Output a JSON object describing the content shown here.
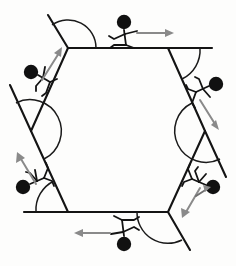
{
  "diagram": {
    "shape_name": "regular-hexagon",
    "sides": 6,
    "exterior_angle_degrees": 60,
    "interior_angle_degrees": 120,
    "exterior_angle_sum_degrees": 360,
    "background_color": "#fdfdfc",
    "line_color": "#141414",
    "arrow_color": "#8a8a8a",
    "figure_color": "#111111",
    "canvas": {
      "width": 236,
      "height": 266
    }
  },
  "hexagon": {
    "center": {
      "x": 118,
      "y": 131
    },
    "vertices": [
      {
        "id": "v-top-left",
        "label": "A",
        "x": 68,
        "y": 48
      },
      {
        "id": "v-top-right",
        "label": "B",
        "x": 168,
        "y": 48
      },
      {
        "id": "v-right",
        "label": "C",
        "x": 205,
        "y": 131
      },
      {
        "id": "v-bottom-right",
        "label": "D",
        "x": 168,
        "y": 212
      },
      {
        "id": "v-bottom-left",
        "label": "E",
        "x": 68,
        "y": 212
      },
      {
        "id": "v-left",
        "label": "F",
        "x": 31,
        "y": 131
      }
    ],
    "edges": [
      {
        "id": "edge-top",
        "from": "A",
        "to": "B"
      },
      {
        "id": "edge-upper-right",
        "from": "B",
        "to": "C"
      },
      {
        "id": "edge-lower-right",
        "from": "C",
        "to": "D"
      },
      {
        "id": "edge-bottom",
        "from": "D",
        "to": "E"
      },
      {
        "id": "edge-lower-left",
        "from": "E",
        "to": "F"
      },
      {
        "id": "edge-upper-left",
        "from": "F",
        "to": "A"
      }
    ]
  },
  "extension_rays": [
    {
      "id": "ray-top-left",
      "at_vertex": "A",
      "x1": 68,
      "y1": 48,
      "x2": 48,
      "y2": 15,
      "note": "upper-left edge extended beyond A"
    },
    {
      "id": "ray-top-right",
      "at_vertex": "B",
      "x1": 168,
      "y1": 48,
      "x2": 210,
      "y2": 48,
      "note": "top edge extended beyond B"
    },
    {
      "id": "ray-right",
      "at_vertex": "C",
      "x1": 205,
      "y1": 131,
      "x2": 226,
      "y2": 166,
      "note": "upper-right edge extended beyond C"
    },
    {
      "id": "ray-bottom-right",
      "at_vertex": "D",
      "x1": 168,
      "y1": 212,
      "x2": 188,
      "y2": 246,
      "note": "lower-right edge extended beyond D"
    },
    {
      "id": "ray-bottom-left",
      "at_vertex": "E",
      "x1": 68,
      "y1": 212,
      "x2": 26,
      "y2": 212,
      "note": "bottom edge extended beyond E"
    },
    {
      "id": "ray-left",
      "at_vertex": "F",
      "x1": 31,
      "y1": 131,
      "x2": 11,
      "y2": 96,
      "note": "lower-left edge extended beyond F"
    }
  ],
  "angle_arcs": [
    {
      "id": "arc-top-left",
      "at_vertex": "A",
      "radius": 27,
      "start_deg": 180,
      "end_deg": 240,
      "measure": 60
    },
    {
      "id": "arc-top-right",
      "at_vertex": "B",
      "radius": 27,
      "start_deg": 0,
      "end_deg": 60,
      "measure": 60
    },
    {
      "id": "arc-right",
      "at_vertex": "C",
      "radius": 27,
      "start_deg": 60,
      "end_deg": 120,
      "measure": 60
    },
    {
      "id": "arc-bottom-right",
      "at_vertex": "D",
      "radius": 27,
      "start_deg": 120,
      "end_deg": 180,
      "measure": 60
    },
    {
      "id": "arc-bottom-left",
      "at_vertex": "E",
      "radius": 27,
      "start_deg": 180,
      "end_deg": 240,
      "measure": 60
    },
    {
      "id": "arc-left",
      "at_vertex": "F",
      "radius": 27,
      "start_deg": 240,
      "end_deg": 300,
      "measure": 60
    }
  ],
  "walkers": [
    {
      "id": "walker-top",
      "position_label": "top edge",
      "head": {
        "x": 124,
        "y": 22
      },
      "standing_on": "edge-top",
      "heading_degrees": 0,
      "direction_label": "right",
      "arrow": {
        "x1": 137,
        "y1": 36,
        "x2": 172,
        "y2": 36
      }
    },
    {
      "id": "walker-upper-left",
      "position_label": "upper-left edge",
      "head": {
        "x": 32,
        "y": 72
      },
      "standing_on": "edge-upper-left",
      "heading_degrees": 60,
      "direction_label": "up-right",
      "arrow": {
        "x1": 42,
        "y1": 78,
        "x2": 61,
        "y2": 50
      }
    },
    {
      "id": "walker-upper-right",
      "position_label": "upper-right edge",
      "head": {
        "x": 216,
        "y": 83
      },
      "standing_on": "edge-upper-right",
      "heading_degrees": -60,
      "direction_label": "down-right",
      "arrow": {
        "x1": 198,
        "y1": 98,
        "x2": 218,
        "y2": 126
      }
    },
    {
      "id": "walker-lower-right",
      "position_label": "lower-right edge",
      "head": {
        "x": 212,
        "y": 186
      },
      "standing_on": "edge-lower-right",
      "heading_degrees": -120,
      "direction_label": "down-left",
      "arrow": {
        "x1": 199,
        "y1": 190,
        "x2": 180,
        "y2": 218
      }
    },
    {
      "id": "walker-bottom",
      "position_label": "bottom edge",
      "head": {
        "x": 124,
        "y": 244
      },
      "standing_on": "edge-bottom",
      "heading_degrees": 180,
      "direction_label": "left",
      "arrow": {
        "x1": 111,
        "y1": 232,
        "x2": 76,
        "y2": 232
      }
    },
    {
      "id": "walker-lower-left",
      "position_label": "lower-left edge",
      "head": {
        "x": 24,
        "y": 186
      },
      "standing_on": "edge-lower-left",
      "heading_degrees": 120,
      "direction_label": "up-left",
      "arrow": {
        "x1": 38,
        "y1": 182,
        "x2": 19,
        "y2": 154
      }
    }
  ]
}
